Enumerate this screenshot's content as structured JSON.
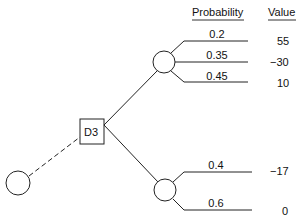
{
  "diagram": {
    "type": "decision-tree",
    "headers": {
      "probability": "Probability",
      "value": "Value"
    },
    "decision_node": {
      "label": "D3"
    },
    "chance_nodes": [
      {
        "id": "upper",
        "branches": [
          {
            "probability": "0.2",
            "value": "55"
          },
          {
            "probability": "0.35",
            "value": "−30"
          },
          {
            "probability": "0.45",
            "value": "10"
          }
        ]
      },
      {
        "id": "lower",
        "branches": [
          {
            "probability": "0.4",
            "value": "−17"
          },
          {
            "probability": "0.6",
            "value": "0"
          }
        ]
      }
    ],
    "root_chance_node": {
      "connection": "dashed"
    },
    "colors": {
      "line": "#222222",
      "background": "#ffffff"
    }
  }
}
